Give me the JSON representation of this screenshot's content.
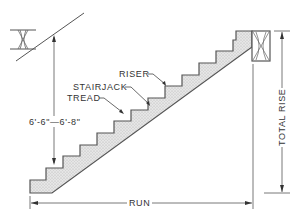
{
  "diagram": {
    "type": "stair-framing-cross-section",
    "labels": {
      "riser": "RISER",
      "stairjack": "STAIRJACK",
      "tread": "TREAD",
      "headroom": "6'-6\"—6'-8\"",
      "run": "RUN",
      "total_rise": "TOTAL RISE"
    },
    "colors": {
      "line": "#555555",
      "fill": "#dcdcdc",
      "background": "#ffffff"
    },
    "step_count": 10
  }
}
